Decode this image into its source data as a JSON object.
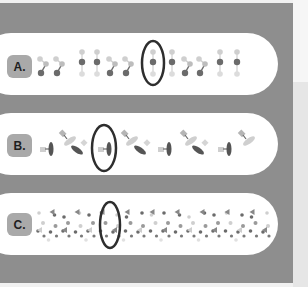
{
  "figure": {
    "rows": [
      {
        "label": "A.",
        "pattern": "dimer-unit-chain",
        "units": 12,
        "highlighted_unit_index": 6
      },
      {
        "label": "B.",
        "pattern": "oriented-molecule-chain",
        "units": 11,
        "highlighted_unit_index": 3
      },
      {
        "label": "C.",
        "pattern": "scattered-mixed-particles",
        "units": 14,
        "highlighted_unit_index": 4
      }
    ],
    "colors": {
      "panel": "#8e8e8e",
      "pill": "#ffffff",
      "label_box": "#a9a9a9",
      "dark_particle": "#6b6b6b",
      "light_particle": "#cfcfcf",
      "highlight_ring": "#2e2e2e"
    }
  }
}
